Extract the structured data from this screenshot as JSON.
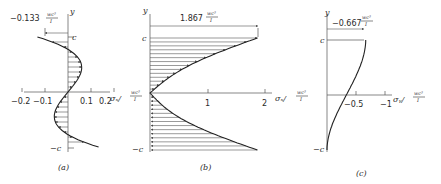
{
  "figure": {
    "panels": [
      {
        "id": "a",
        "caption": "(a)",
        "y_axis_label": "y",
        "top_label": "c",
        "bottom_label": "−c",
        "annotation_value": "−0.133",
        "annotation_unit_num": "wc³",
        "annotation_unit_den": "I",
        "x_axis_label": "σₓ/",
        "x_axis_unit_num": "wc³",
        "x_axis_unit_den": "I",
        "x_ticks": [
          "−0.2",
          "−0.1",
          "0.1",
          "0.2"
        ],
        "x_tick_values": [
          -0.2,
          -0.1,
          0.1,
          0.2
        ],
        "curve": "cubic shear-like stress σx(y): −0.133 at y=c, 0 at y=0, +0.133 at y=−c"
      },
      {
        "id": "b",
        "caption": "(b)",
        "y_axis_label": "y",
        "top_label": "c",
        "bottom_label": "−c",
        "annotation_value": "1.867",
        "annotation_unit_num": "wc³",
        "annotation_unit_den": "I",
        "x_axis_label": "σₓ/",
        "x_axis_unit_num": "wc³",
        "x_axis_unit_den": "I",
        "x_ticks": [
          "1",
          "2"
        ],
        "x_tick_values": [
          1,
          2
        ],
        "curve": "V-shaped magnitude distribution: 1.867 at y=c, 0 at y=0, ~1.867 at y=−c"
      },
      {
        "id": "c",
        "caption": "(c)",
        "y_axis_label": "y",
        "top_label": "c",
        "bottom_label": "−c",
        "annotation_value": "−0.667",
        "annotation_unit_num": "wc³",
        "annotation_unit_den": "I",
        "x_axis_label": "σᵧ/",
        "x_axis_unit_num": "wc³",
        "x_axis_unit_den": "I",
        "x_ticks": [
          "−0.5",
          "−1"
        ],
        "x_tick_values": [
          -0.5,
          -1
        ],
        "curve": "σy(y): −0.667 at y=c, ~−0.33 at y=0, 0 at y=−c"
      }
    ]
  }
}
